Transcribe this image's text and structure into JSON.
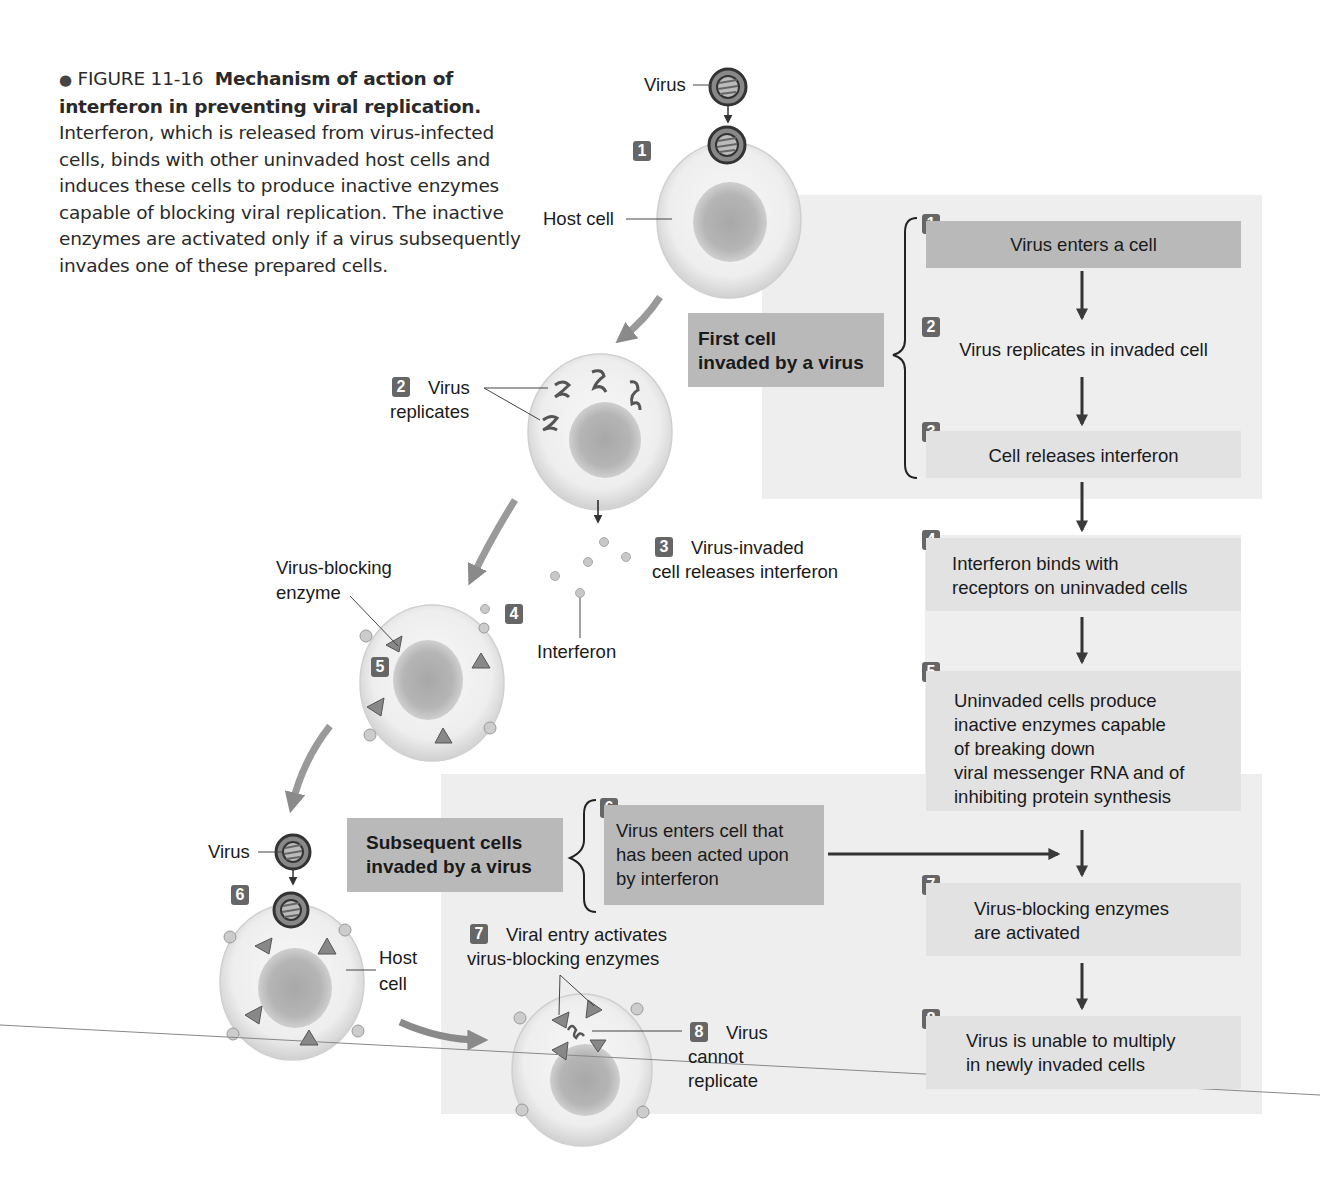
{
  "caption": {
    "bullet": "●",
    "figure_number": "FIGURE 11-16",
    "title": "Mechanism of action of interferon in preventing viral replication.",
    "body": "Interferon, which is released from virus-infected cells, binds with other uninvaded host cells and induces these cells to produce inactive enzymes capable of blocking viral replication. The inactive enzymes are activated only if a virus subsequently invades one of these prepared cells.",
    "lines": [
      [
        "FIGURE 11-16",
        "Mechanism of action of inter-",
        ""
      ],
      [
        "",
        "feron in preventing viral replication.",
        "Inter-"
      ],
      [
        "",
        "",
        "feron, which is released from virus-infected"
      ],
      [
        "",
        "",
        "cells, binds with other uninvaded host cells and"
      ],
      [
        "",
        "",
        "induces these cells to produce inactive en-"
      ],
      [
        "",
        "",
        "zymes capable of blocking viral replication. The"
      ],
      [
        "",
        "",
        "inactive enzymes are activated only if a virus"
      ],
      [
        "",
        "",
        "subsequently invades one of these prepared"
      ],
      [
        "",
        "",
        "cells."
      ]
    ]
  },
  "illustration": {
    "labels": {
      "virus_top": "Virus",
      "host_cell_top": "Host cell",
      "badge_1": "1",
      "badge_2": "2",
      "virus_replicates_1": "Virus",
      "virus_replicates_2": "replicates",
      "badge_3": "3",
      "virus_invaded_1": "Virus-invaded",
      "virus_invaded_2": "cell releases interferon",
      "virus_blocking_1": "Virus-blocking",
      "virus_blocking_2": "enzyme",
      "badge_4": "4",
      "badge_5": "5",
      "interferon": "Interferon",
      "virus_bottom": "Virus",
      "badge_6": "6",
      "host_cell_bottom_1": "Host",
      "host_cell_bottom_2": "cell",
      "badge_7": "7",
      "viral_entry_1": "Viral entry activates",
      "viral_entry_2": "virus-blocking enzymes",
      "badge_8": "8",
      "cannot_1": "Virus",
      "cannot_2": "cannot",
      "cannot_3": "replicate"
    }
  },
  "flowchart": {
    "group_first": {
      "line1": "First cell",
      "line2": "invaded by a virus"
    },
    "group_subsequent": {
      "line1": "Subsequent cells",
      "line2": "invaded by a virus"
    },
    "steps": [
      {
        "num": "1",
        "lines": [
          "Virus enters a cell"
        ]
      },
      {
        "num": "2",
        "lines": [
          "Virus replicates in invaded cell"
        ]
      },
      {
        "num": "3",
        "lines": [
          "Cell releases interferon"
        ]
      },
      {
        "num": "4",
        "lines": [
          "Interferon binds with",
          "receptors on uninvaded cells"
        ]
      },
      {
        "num": "5",
        "lines": [
          "Uninvaded cells produce",
          "inactive enzymes capable",
          "of breaking down",
          "viral messenger RNA and of",
          "inhibiting protein synthesis"
        ]
      },
      {
        "num": "6",
        "lines": [
          "Virus enters cell that",
          "has been acted upon",
          "by interferon"
        ]
      },
      {
        "num": "7",
        "lines": [
          "Virus-blocking enzymes",
          "are activated"
        ]
      },
      {
        "num": "8",
        "lines": [
          "Virus is unable to multiply",
          "in newly invaded cells"
        ]
      }
    ]
  },
  "colors": {
    "panel_bg": "#eeeeee",
    "dark_box": "#b9b9b9",
    "light_box": "#e2e2e2",
    "badge": "#666666",
    "arrow": "#333333",
    "curved_arrow": "#8a8a8a"
  }
}
